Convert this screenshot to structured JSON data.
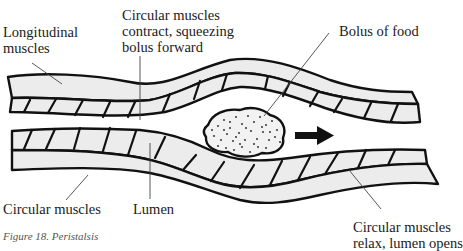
{
  "figure": {
    "caption": "Figure 18. Peristalsis",
    "labels": {
      "longitudinal": [
        "Longitudinal",
        "muscles"
      ],
      "circular_contract": [
        "Circular muscles",
        "contract, squeezing",
        "bolus forward"
      ],
      "bolus": "Bolus of food",
      "circular_bottom": "Circular muscles",
      "lumen": "Lumen",
      "circular_relax": [
        "Circular muscles",
        "relax, lumen opens"
      ]
    },
    "colors": {
      "outline": "#111111",
      "wall_fill": "#ececec",
      "background": "#ffffff",
      "arrow": "#111111"
    },
    "direction_arrow": "right"
  }
}
